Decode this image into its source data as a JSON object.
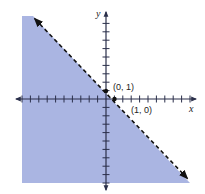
{
  "chart_data": {
    "type": "line",
    "title": "",
    "subtitle": "",
    "xlabel": "x",
    "ylabel": "y",
    "xlim": [
      -10,
      10
    ],
    "ylim": [
      -10,
      10
    ],
    "grid": false,
    "legend": null,
    "tick_step": 1,
    "series": [
      {
        "name": "boundary y = 1 - x",
        "style": "dashed",
        "arrows": "both",
        "x": [
          -9,
          10
        ],
        "y": [
          10,
          -9
        ]
      }
    ],
    "shaded_region": {
      "inequality": "x + y < 1",
      "side": "below-left of boundary",
      "color": "#a9b4e0"
    },
    "points": [
      {
        "x": 0,
        "y": 1,
        "label": "(0, 1)"
      },
      {
        "x": 1,
        "y": 0,
        "label": "(1, 0)"
      }
    ]
  },
  "labels": {
    "x_axis": "x",
    "y_axis": "y",
    "point_a": "(0, 1)",
    "point_b": "(1, 0)"
  },
  "colors": {
    "shade": "#aab5e2",
    "axis": "#2a2f4a",
    "line": "#111111",
    "text": "#222222"
  }
}
